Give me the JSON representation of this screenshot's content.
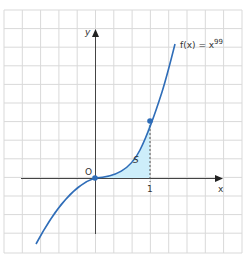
{
  "figure": {
    "function_label": "f(x) = x",
    "function_exponent": "99",
    "x_axis_label": "x",
    "y_axis_label": "y",
    "origin_label": "O",
    "tick_label_1": "1",
    "area_label": "S"
  },
  "colors": {
    "curve": "#2f6db8",
    "area_fill": "#cdeefa",
    "grid": "#d9d9d9",
    "axis": "#333333"
  }
}
